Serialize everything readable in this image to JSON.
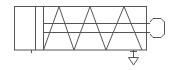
{
  "diagram": {
    "type": "pneumatic-cylinder-symbol",
    "colors": {
      "stroke": "#555555",
      "background": "#ffffff"
    },
    "components": [
      "cylinder-body",
      "piston",
      "spring",
      "piston-rod",
      "rod-end",
      "port",
      "exhaust-triangle"
    ]
  }
}
